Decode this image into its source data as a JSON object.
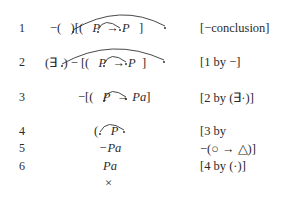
{
  "proof": {
    "lines": [
      {
        "num": "1",
        "formula_prefix": "−(",
        "formula_mid": ")[(",
        "formula_p": "P",
        "formula_rest": "→",
        "formula_p2": "P",
        "formula_end": "]",
        "justification": "[−conclusion]"
      },
      {
        "num": "2",
        "formula_prefix": "(∃",
        "formula_mid": ") − [(",
        "formula_p": "P",
        "formula_rest": "→",
        "formula_p2": "P",
        "formula_end": "]",
        "justification": "[1 by −]"
      },
      {
        "num": "3",
        "formula_prefix": "−[(",
        "formula_p": "P",
        "formula_rest": "→",
        "formula_p2": "Pa",
        "formula_end": "]",
        "justification": "[2 by (∃·)]"
      },
      {
        "num": "4",
        "formula_prefix": "(",
        "formula_p": "P",
        "justification": "[3 by"
      },
      {
        "num": "5",
        "formula": "−Pa",
        "justification": "−(○ → △)]"
      },
      {
        "num": "6",
        "formula": "Pa",
        "justification": "[4 by (·)]"
      }
    ],
    "closing_mark": "×"
  }
}
